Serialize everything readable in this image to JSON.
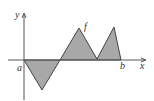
{
  "diagram": {
    "type": "function-area",
    "labels": {
      "x_axis": "x",
      "y_axis": "y",
      "function": "f",
      "left_bound": "a",
      "right_bound": "b"
    },
    "function_vertices": [
      {
        "x": 0,
        "y": 0
      },
      {
        "x": 1,
        "y": -1.7
      },
      {
        "x": 2,
        "y": 0
      },
      {
        "x": 3,
        "y": 1.8
      },
      {
        "x": 4,
        "y": 0.05
      },
      {
        "x": 5,
        "y": 1.85
      },
      {
        "x": 5.4,
        "y": 0
      }
    ],
    "colors": {
      "fill": "#a8a8a8",
      "stroke": "#444444",
      "axis": "#555555"
    }
  }
}
